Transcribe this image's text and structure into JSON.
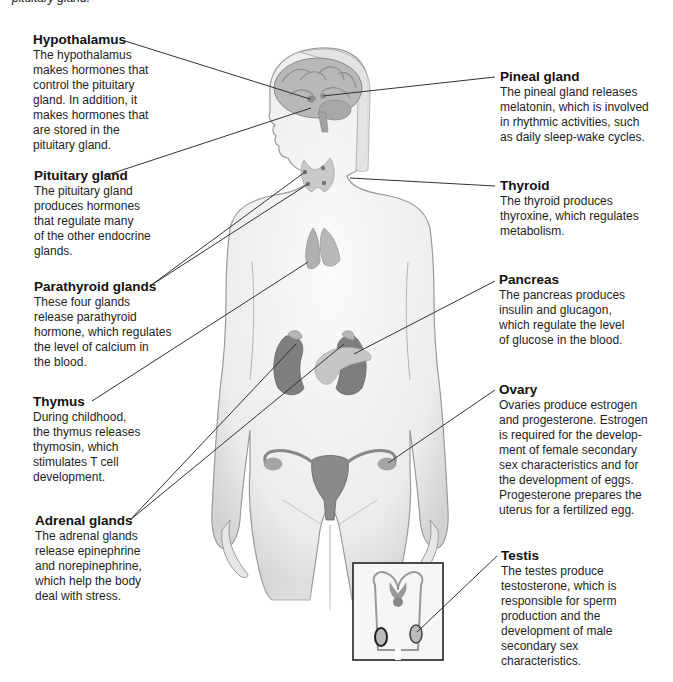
{
  "caption_fragment": "pituitary gland.",
  "labels": {
    "hypothalamus": {
      "title": "Hypothalamus",
      "lines": [
        "The hypothalamus",
        "makes hormones that",
        "control the pituitary",
        "gland. In addition, it",
        "makes hormones that",
        "are stored in the",
        "pituitary gland."
      ]
    },
    "pituitary": {
      "title": "Pituitary gland",
      "lines": [
        "The pituitary gland",
        "produces hormones",
        "that regulate many",
        "of the other endocrine",
        "glands."
      ]
    },
    "parathyroid": {
      "title": "Parathyroid glands",
      "lines": [
        "These four glands",
        "release parathyroid",
        "hormone, which regulates",
        "the level of calcium in",
        "the blood."
      ]
    },
    "thymus": {
      "title": "Thymus",
      "lines": [
        "During childhood,",
        "the thymus releases",
        "thymosin, which",
        "stimulates T cell",
        "development."
      ]
    },
    "adrenal": {
      "title": "Adrenal glands",
      "lines": [
        "The adrenal glands",
        "release epinephrine",
        "and norepinephrine,",
        "which help the body",
        "deal with stress."
      ]
    },
    "pineal": {
      "title": "Pineal gland",
      "lines": [
        "The pineal gland releases",
        "melatonin, which is involved",
        "in rhythmic activities, such",
        "as daily sleep-wake cycles."
      ]
    },
    "thyroid": {
      "title": "Thyroid",
      "lines": [
        "The thyroid produces",
        "thyroxine, which regulates",
        "metabolism."
      ]
    },
    "pancreas": {
      "title": "Pancreas",
      "lines": [
        "The pancreas produces",
        "insulin and glucagon,",
        "which regulate the level",
        "of glucose in the blood."
      ]
    },
    "ovary": {
      "title": "Ovary",
      "lines": [
        "Ovaries produce estrogen",
        "and progesterone. Estrogen",
        "is required for the develop-",
        "ment of female secondary",
        "sex characteristics and for",
        "the development of eggs.",
        "Progesterone prepares the",
        "uterus for a fertilized egg."
      ]
    },
    "testis": {
      "title": "Testis",
      "lines": [
        "The testes produce",
        "testosterone, which is",
        "responsible for sperm",
        "production and the",
        "development of male",
        "secondary sex",
        "characteristics."
      ]
    }
  },
  "colors": {
    "skin_fill": "#eeeeee",
    "skin_outline": "#9a9a9a",
    "organ_dark": "#777777",
    "organ_mid": "#a8a8a8",
    "organ_light": "#c4c4c4",
    "leader_line": "#333333",
    "inset_border": "#222222"
  }
}
